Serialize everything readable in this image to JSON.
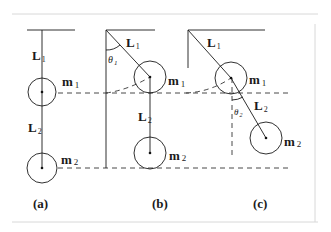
{
  "figure": {
    "panels": [
      {
        "id": "a",
        "caption": "(a)",
        "labels": {
          "L1": "L",
          "L1_sub": "1",
          "L2": "L",
          "L2_sub": "2",
          "m1": "m",
          "m1_sub": "1",
          "m2": "m",
          "m2_sub": "2"
        }
      },
      {
        "id": "b",
        "caption": "(b)",
        "labels": {
          "L1": "L",
          "L1_sub": "1",
          "L2": "L",
          "L2_sub": "2",
          "m1": "m",
          "m1_sub": "1",
          "m2": "m",
          "m2_sub": "2",
          "theta1": "θ",
          "theta1_sub": "1"
        }
      },
      {
        "id": "c",
        "caption": "(c)",
        "labels": {
          "L1": "L",
          "L1_sub": "1",
          "L2": "L",
          "L2_sub": "2",
          "m1": "m",
          "m1_sub": "1",
          "m2": "m",
          "m2_sub": "2",
          "theta2": "θ",
          "theta2_sub": "2"
        }
      }
    ]
  }
}
